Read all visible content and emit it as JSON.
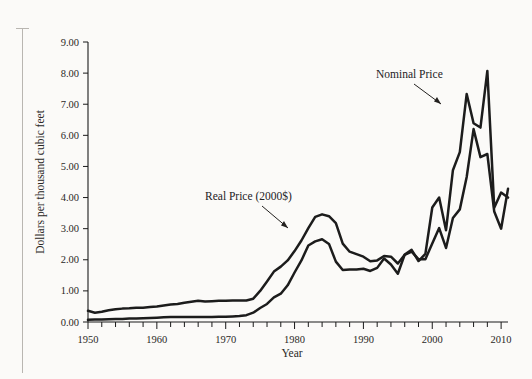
{
  "figure": {
    "background_color": "#fbfaf8",
    "ink_color": "#1c1c1c"
  },
  "chart_data": {
    "type": "line",
    "title": "",
    "xlabel": "Year",
    "ylabel": "Dollars per thousand cubic feet",
    "xlim": [
      1950,
      2011
    ],
    "ylim": [
      0.0,
      9.0
    ],
    "grid": false,
    "legend_position": "inline-annotations",
    "x_tick_labels": [
      "1950",
      "1960",
      "1970",
      "1980",
      "1990",
      "2000",
      "2010"
    ],
    "x_tick_values": [
      1950,
      1960,
      1970,
      1980,
      1990,
      2000,
      2010
    ],
    "x_minor_tick_step": 2,
    "y_tick_labels": [
      "0.00",
      "1.00",
      "2.00",
      "3.00",
      "4.00",
      "5.00",
      "6.00",
      "7.00",
      "8.00",
      "9.00"
    ],
    "y_tick_values": [
      0,
      1,
      2,
      3,
      4,
      5,
      6,
      7,
      8,
      9
    ],
    "x": [
      1950,
      1951,
      1952,
      1953,
      1954,
      1955,
      1956,
      1957,
      1958,
      1959,
      1960,
      1961,
      1962,
      1963,
      1964,
      1965,
      1966,
      1967,
      1968,
      1969,
      1970,
      1971,
      1972,
      1973,
      1974,
      1975,
      1976,
      1977,
      1978,
      1979,
      1980,
      1981,
      1982,
      1983,
      1984,
      1985,
      1986,
      1987,
      1988,
      1989,
      1990,
      1991,
      1992,
      1993,
      1994,
      1995,
      1996,
      1997,
      1998,
      1999,
      2000,
      2001,
      2002,
      2003,
      2004,
      2005,
      2006,
      2007,
      2008,
      2009,
      2010,
      2011
    ],
    "series": [
      {
        "name": "Real Price (2000$)",
        "annotation": "Real Price (2000$)",
        "values": [
          0.36,
          0.3,
          0.33,
          0.38,
          0.41,
          0.43,
          0.44,
          0.46,
          0.46,
          0.48,
          0.5,
          0.53,
          0.56,
          0.58,
          0.62,
          0.65,
          0.68,
          0.66,
          0.67,
          0.68,
          0.68,
          0.69,
          0.69,
          0.69,
          0.75,
          1.0,
          1.3,
          1.62,
          1.78,
          1.98,
          2.28,
          2.62,
          3.02,
          3.38,
          3.46,
          3.4,
          3.18,
          2.52,
          2.26,
          2.18,
          2.1,
          1.95,
          1.98,
          2.12,
          2.1,
          1.88,
          2.16,
          2.26,
          2.02,
          2.02,
          2.52,
          3.02,
          2.38,
          3.34,
          3.62,
          4.66,
          6.2,
          5.3,
          5.4,
          3.55,
          3.0,
          4.28
        ]
      },
      {
        "name": "Nominal Price",
        "annotation": "Nominal Price",
        "values": [
          0.07,
          0.08,
          0.08,
          0.09,
          0.1,
          0.1,
          0.11,
          0.11,
          0.12,
          0.13,
          0.14,
          0.15,
          0.16,
          0.16,
          0.16,
          0.16,
          0.16,
          0.16,
          0.16,
          0.17,
          0.17,
          0.18,
          0.19,
          0.22,
          0.3,
          0.45,
          0.58,
          0.79,
          0.91,
          1.18,
          1.59,
          1.98,
          2.46,
          2.59,
          2.66,
          2.51,
          1.94,
          1.67,
          1.69,
          1.69,
          1.71,
          1.64,
          1.74,
          2.04,
          1.85,
          1.55,
          2.17,
          2.32,
          1.96,
          2.19,
          3.68,
          4.0,
          2.95,
          4.88,
          5.46,
          7.33,
          6.39,
          6.25,
          8.07,
          3.67,
          4.16,
          4.0
        ]
      }
    ],
    "annotations": [
      {
        "text": "Real Price (2000$)",
        "target_year": 1982,
        "target_value": 3.05
      },
      {
        "text": "Nominal Price",
        "target_year": 2004,
        "target_value": 6.25
      }
    ]
  }
}
